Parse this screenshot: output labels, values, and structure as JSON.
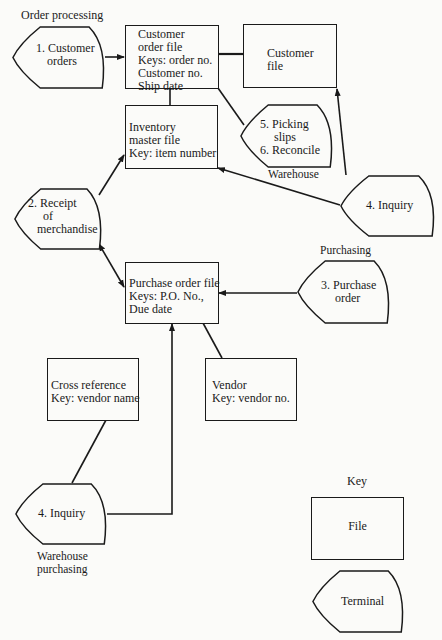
{
  "sections": {
    "order_processing": "Order processing",
    "warehouse": "Warehouse",
    "purchasing": "Purchasing",
    "warehouse_purchasing": [
      "Warehouse",
      "purchasing"
    ],
    "key": "Key"
  },
  "files": {
    "customer_order_file": [
      "Customer",
      "order file",
      "Keys: order no.",
      "Customer no.",
      "Ship date"
    ],
    "customer_file": [
      "Customer",
      "file"
    ],
    "inventory_master_file": [
      "Inventory",
      "master file",
      "Key:  item number"
    ],
    "purchase_order_file": [
      "Purchase order file",
      "Keys:  P.O. No.,",
      "Due date"
    ],
    "cross_reference": [
      "Cross reference",
      "Key: vendor name"
    ],
    "vendor": [
      "Vendor",
      "Key:  vendor no."
    ]
  },
  "terminals": {
    "customer_orders": [
      "1.  Customer",
      "orders"
    ],
    "picking_reconcile": [
      "5.  Picking",
      "slips",
      "6.  Reconcile"
    ],
    "inquiry_warehouse": [
      "4.  Inquiry"
    ],
    "receipt_of_merchandise": [
      "2.  Receipt",
      "of",
      "merchandise"
    ],
    "purchase_order": [
      "3.  Purchase",
      "order"
    ],
    "inquiry_warehouse_purchasing": [
      "4.  Inquiry"
    ]
  },
  "legend": {
    "file": "File",
    "terminal": "Terminal"
  },
  "connections": [
    {
      "from": "customer_orders",
      "to": "customer_order_file",
      "arrow": "to"
    },
    {
      "from": "customer_order_file",
      "to": "customer_file",
      "arrow": "none"
    },
    {
      "from": "customer_order_file",
      "to": "inventory_master_file",
      "arrow": "none"
    },
    {
      "from": "customer_order_file",
      "to": "picking_reconcile",
      "arrow": "none"
    },
    {
      "from": "inquiry_warehouse",
      "to": "customer_file",
      "arrow": "to"
    },
    {
      "from": "inquiry_warehouse",
      "to": "inventory_master_file",
      "arrow": "to"
    },
    {
      "from": "receipt_of_merchandise",
      "to": "inventory_master_file",
      "arrow": "to"
    },
    {
      "from": "receipt_of_merchandise",
      "to": "purchase_order_file",
      "arrow": "both"
    },
    {
      "from": "purchase_order",
      "to": "purchase_order_file",
      "arrow": "to"
    },
    {
      "from": "purchase_order_file",
      "to": "vendor",
      "arrow": "none"
    },
    {
      "from": "cross_reference",
      "to": "inquiry_warehouse_purchasing",
      "arrow": "none"
    },
    {
      "from": "inquiry_warehouse_purchasing",
      "to": "purchase_order_file",
      "arrow": "to"
    }
  ]
}
